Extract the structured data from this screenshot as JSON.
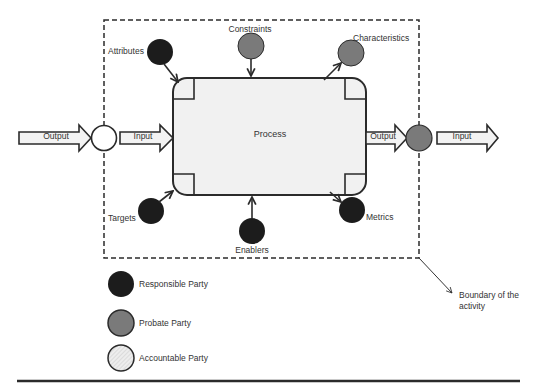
{
  "diagram": {
    "process": {
      "label": "Process"
    },
    "boundary": {
      "label_line1": "Boundary of the",
      "label_line2": "activity"
    },
    "flows": {
      "left_output": "Output",
      "left_input": "Input",
      "right_output": "Output",
      "right_input": "Input"
    },
    "nodes": {
      "attributes": {
        "label": "Attributes",
        "party": "responsible"
      },
      "constraints": {
        "label": "Constraints",
        "party": "probate"
      },
      "characteristics": {
        "label": "Characteristics",
        "party": "probate"
      },
      "targets": {
        "label": "Targets",
        "party": "responsible"
      },
      "enablers": {
        "label": "Enablers",
        "party": "responsible"
      },
      "metrics": {
        "label": "Metrics",
        "party": "responsible"
      },
      "left_interface": {
        "party": "accountable"
      },
      "right_interface": {
        "party": "probate"
      }
    },
    "legend": [
      {
        "label": "Responsible Party",
        "color": "#1c1c1c"
      },
      {
        "label": "Probate Party",
        "color": "#7a7a7a"
      },
      {
        "label": "Accountable Party",
        "color": "#e6e6e6"
      }
    ],
    "colors": {
      "responsible": "#1c1c1c",
      "probate": "#7a7a7a",
      "accountable": "#ffffff",
      "process_fill": "#f1f1f1",
      "stroke": "#2b2b2b"
    }
  }
}
